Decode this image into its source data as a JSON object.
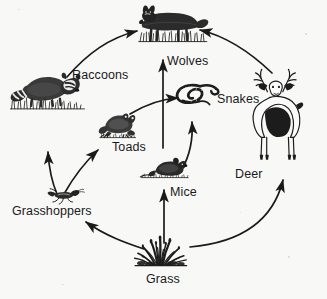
{
  "diagram": {
    "type": "food-web",
    "background_color": "#f8f8f7",
    "ink_color": "#1a1a1a",
    "nodes": [
      {
        "id": "wolves",
        "label": "Wolves",
        "icon": "wolf-illustration",
        "label_x": 167,
        "label_y": 55,
        "trophic": "tertiary consumer"
      },
      {
        "id": "raccoons",
        "label": "Raccoons",
        "icon": "raccoon-illustration",
        "label_x": 72,
        "label_y": 69,
        "trophic": "secondary consumer"
      },
      {
        "id": "snakes",
        "label": "Snakes",
        "icon": "snake-illustration",
        "label_x": 217,
        "label_y": 93,
        "trophic": "secondary consumer"
      },
      {
        "id": "deer",
        "label": "Deer",
        "icon": "deer-illustration",
        "label_x": 235,
        "label_y": 168,
        "trophic": "primary consumer"
      },
      {
        "id": "toads",
        "label": "Toads",
        "icon": "toad-illustration",
        "label_x": 112,
        "label_y": 141,
        "trophic": "secondary consumer"
      },
      {
        "id": "mice",
        "label": "Mice",
        "icon": "mouse-illustration",
        "label_x": 170,
        "label_y": 186,
        "trophic": "primary consumer"
      },
      {
        "id": "grasshoppers",
        "label": "Grasshoppers",
        "icon": "grasshopper-illustration",
        "label_x": 12,
        "label_y": 205,
        "trophic": "primary consumer"
      },
      {
        "id": "grass",
        "label": "Grass",
        "icon": "grass-illustration",
        "label_x": 146,
        "label_y": 273,
        "trophic": "producer"
      }
    ],
    "edges": [
      {
        "from": "grass",
        "to": "grasshoppers",
        "style": "curved-arrow"
      },
      {
        "from": "grass",
        "to": "mice",
        "style": "straight-arrow"
      },
      {
        "from": "grass",
        "to": "deer",
        "style": "curved-arrow"
      },
      {
        "from": "grasshoppers",
        "to": "raccoons",
        "style": "curved-arrow"
      },
      {
        "from": "grasshoppers",
        "to": "toads",
        "style": "curved-arrow"
      },
      {
        "from": "toads",
        "to": "snakes",
        "style": "curved-arrow"
      },
      {
        "from": "toads",
        "to": "wolves",
        "style": "straight-arrow"
      },
      {
        "from": "mice",
        "to": "snakes",
        "style": "curved-arrow"
      },
      {
        "from": "raccoons",
        "to": "wolves",
        "style": "curved-arrow"
      },
      {
        "from": "deer",
        "to": "wolves",
        "style": "curved-arrow"
      }
    ]
  }
}
